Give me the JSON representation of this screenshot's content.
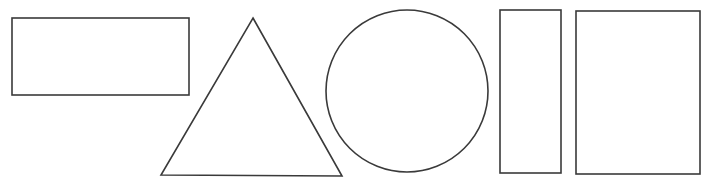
{
  "canvas": {
    "width": 710,
    "height": 185,
    "background": "#ffffff"
  },
  "style": {
    "stroke": "#3a3a3a",
    "stroke_width": 1.6,
    "fill": "#ffffff"
  },
  "shapes": [
    {
      "id": "wide-rectangle",
      "type": "rect",
      "x": 12,
      "y": 18,
      "w": 177,
      "h": 77
    },
    {
      "id": "triangle",
      "type": "polygon",
      "points": [
        [
          253,
          18
        ],
        [
          342,
          176
        ],
        [
          161,
          175
        ]
      ]
    },
    {
      "id": "circle",
      "type": "circle",
      "cx": 407,
      "cy": 91,
      "r": 81
    },
    {
      "id": "tall-rectangle",
      "type": "rect",
      "x": 500,
      "y": 10,
      "w": 61,
      "h": 163
    },
    {
      "id": "large-rectangle",
      "type": "rect",
      "x": 576,
      "y": 11,
      "w": 124,
      "h": 163
    }
  ]
}
